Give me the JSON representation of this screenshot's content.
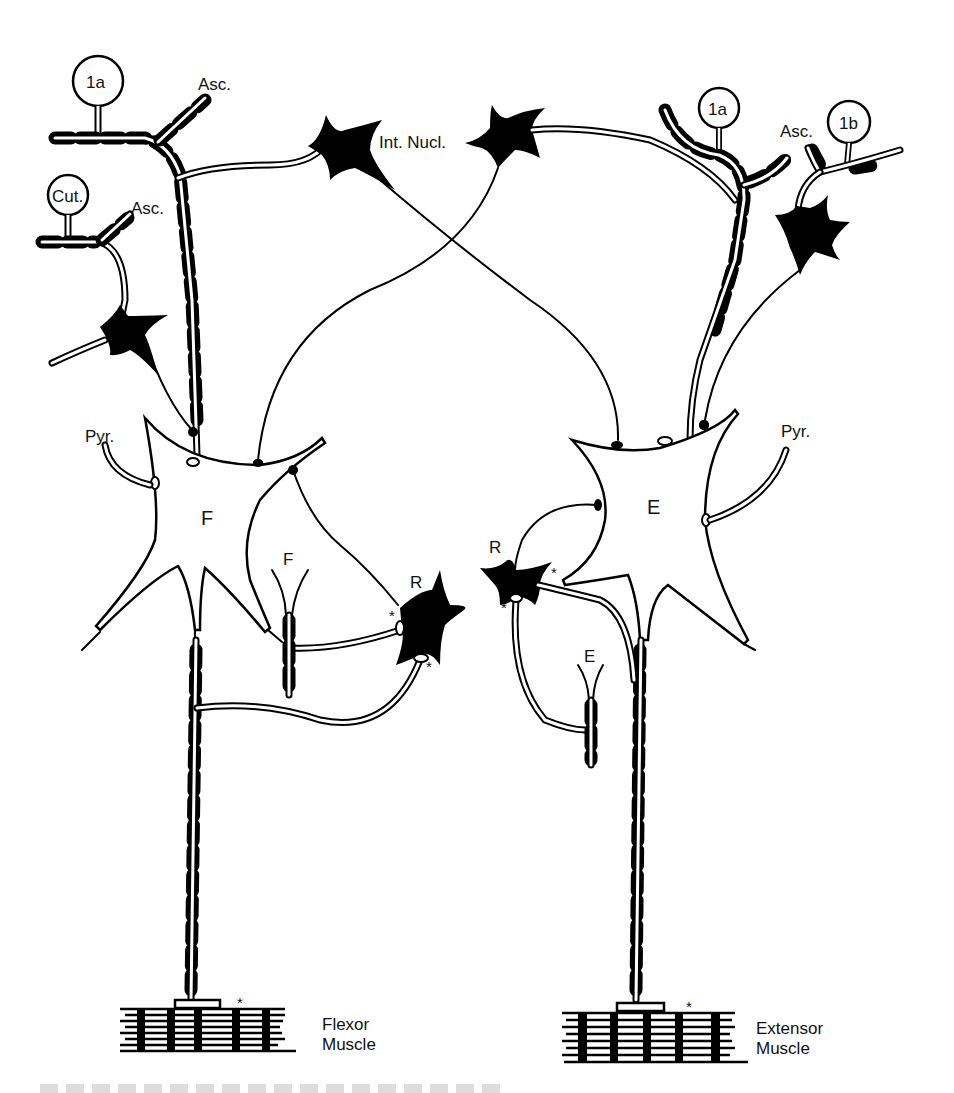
{
  "diagram": {
    "type": "schematic neural circuit diagram",
    "labels": {
      "afferent_1a_left": "1a",
      "afferent_cut": "Cut.",
      "asc_left_top": "Asc.",
      "asc_left_mid": "Asc.",
      "interneuron_label": "Int. Nucl.",
      "afferent_1a_right": "1a",
      "afferent_1b": "1b",
      "asc_right": "Asc.",
      "pyr_left": "Pyr.",
      "pyr_right": "Pyr.",
      "motoneuron_flexor": "F",
      "motoneuron_extensor": "E",
      "renshaw_left": "R",
      "renshaw_right": "R",
      "recurrent_flexor": "F",
      "recurrent_extensor": "E",
      "flexor_muscle_line1": "Flexor",
      "flexor_muscle_line2": "Muscle",
      "extensor_muscle_line1": "Extensor",
      "extensor_muscle_line2": "Muscle",
      "asterisk": "*"
    },
    "colors": {
      "ink": "#000000",
      "paper": "#ffffff"
    }
  }
}
